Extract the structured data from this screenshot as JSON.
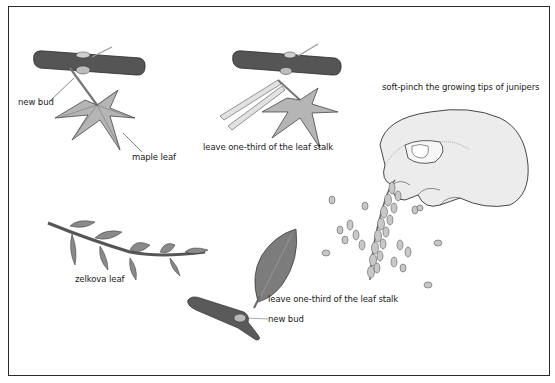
{
  "figure": {
    "labels": {
      "maple_new_bud": "new bud",
      "maple_leaf": "maple leaf",
      "maple_leave_stalk": "leave one-third of the leaf stalk",
      "juniper_pinch": "soft-pinch the growing tips of junipers",
      "zelkova_leaf": "zelkova leaf",
      "zelkova_leave_stalk": "leave one-third of the leaf stalk",
      "zelkova_new_bud": "new bud"
    },
    "colors": {
      "branch": "#4a4a4a",
      "leaf_light": "#b8b8b8",
      "leaf_dark": "#7a7a7a",
      "outline": "#2a2a2a",
      "hand": "#e8e8e8",
      "frame": "#2a2a2a"
    },
    "illustrations": [
      "maple-branch-with-leaf",
      "maple-branch-with-scissors",
      "hand-pinching-juniper",
      "zelkova-branch",
      "zelkova-leaf-and-bud",
      "juniper-sprig"
    ]
  }
}
